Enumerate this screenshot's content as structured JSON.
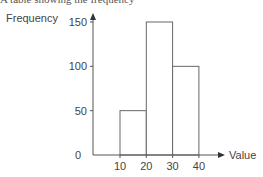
{
  "chart_data": {
    "type": "bar",
    "subtype": "histogram",
    "title": "",
    "xlabel": "Value",
    "ylabel": "Frequency",
    "bins": [
      [
        10,
        20
      ],
      [
        20,
        30
      ],
      [
        30,
        40
      ]
    ],
    "categories": [
      "10-20",
      "20-30",
      "30-40"
    ],
    "values": [
      50,
      150,
      100
    ],
    "x_ticks": [
      "10",
      "20",
      "30",
      "40"
    ],
    "y_ticks": [
      "0",
      "50",
      "100",
      "150"
    ],
    "xlim": [
      0,
      45
    ],
    "ylim": [
      0,
      150
    ],
    "grid": false,
    "legend": null,
    "colors": {
      "bar_fill": "#ffffff",
      "bar_stroke": "#666666",
      "axis": "#555555"
    }
  },
  "overflow_text": "A table showing the frequency"
}
